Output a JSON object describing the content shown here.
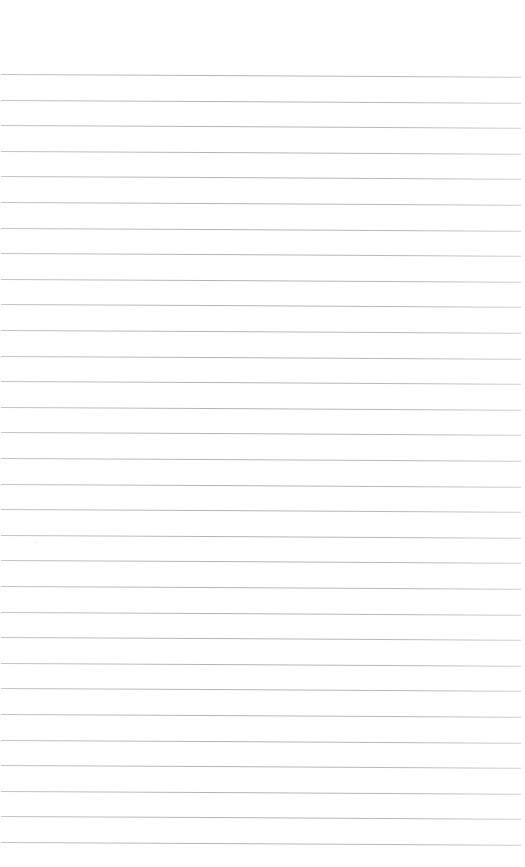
{
  "page": {
    "type": "blank lined paper",
    "background_color": "#ffffff",
    "rule_color": "#b8b8b8",
    "rule_count": 31,
    "first_rule_y": 74,
    "rule_spacing": 25.6,
    "rule_left": 1,
    "rule_width": 520
  }
}
